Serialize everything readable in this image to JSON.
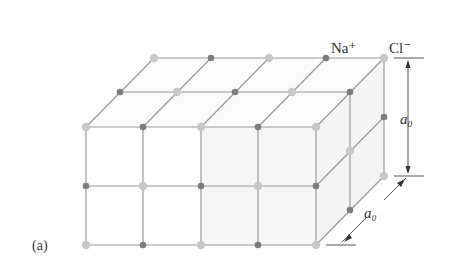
{
  "figure": {
    "panel_label": "(a)",
    "ion_labels": {
      "sodium": "Na⁺",
      "chloride": "Cl⁻"
    },
    "dimension_labels": {
      "vertical": "a₀",
      "depth": "a₀"
    },
    "colors": {
      "sodium_ion": "#7d7d7d",
      "chloride_ion": "#c8c8c8",
      "lattice_line": "#9a9a9a",
      "shading": "#f3f3f3",
      "dimension_line": "#555555"
    }
  }
}
